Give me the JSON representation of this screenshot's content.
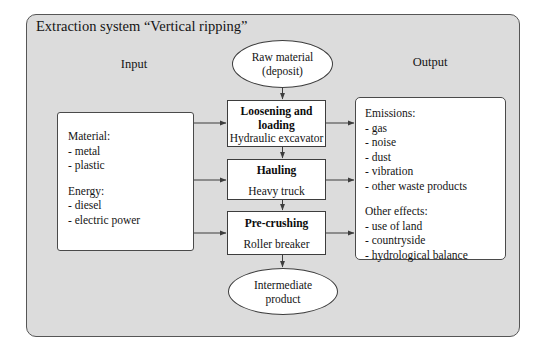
{
  "diagram": {
    "title": "Extraction system “Vertical ripping”",
    "columns": {
      "input_label": "Input",
      "output_label": "Output"
    },
    "colors": {
      "frame_background": "#dcdcdc",
      "frame_border": "#565656",
      "node_background": "#ffffff",
      "node_border": "#3d3d3d",
      "text": "#141414",
      "page_background": "#ffffff"
    },
    "source_node": {
      "shape": "ellipse",
      "line1": "Raw material",
      "line2": "(deposit)"
    },
    "sink_node": {
      "shape": "ellipse",
      "line1": "Intermediate",
      "line2": "product"
    },
    "input_box": {
      "groups": [
        {
          "heading": "Material:",
          "items": [
            "- metal",
            "- plastic"
          ]
        },
        {
          "heading": "Energy:",
          "items": [
            "- diesel",
            "- electric power"
          ]
        }
      ]
    },
    "output_box": {
      "groups": [
        {
          "heading": "Emissions:",
          "items": [
            "- gas",
            "- noise",
            "- dust",
            "- vibration",
            "- other waste products"
          ]
        },
        {
          "heading": "Other effects:",
          "items": [
            "- use of land",
            "- countryside",
            "- hydrological balance"
          ]
        }
      ]
    },
    "processes": [
      {
        "title": "Loosening and loading",
        "title_line1": "Loosening and",
        "title_line2": "loading",
        "equipment": "Hydraulic excavator"
      },
      {
        "title": "Hauling",
        "equipment": "Heavy truck"
      },
      {
        "title": "Pre-crushing",
        "equipment": "Roller breaker"
      }
    ],
    "watermark": ""
  }
}
